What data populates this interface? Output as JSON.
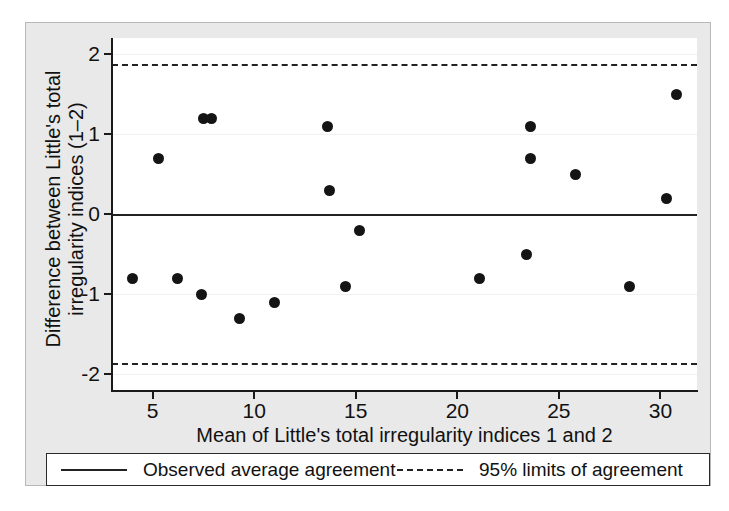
{
  "chart_data": {
    "type": "scatter",
    "title": "",
    "xlabel": "Mean of Little's total irregularity indices 1 and 2",
    "ylabel_line1": "Difference between Little's total",
    "ylabel_line2": "irregularity indices (1–2)",
    "xlim": [
      3.0,
      31.8
    ],
    "ylim": [
      -2.2,
      2.2
    ],
    "xticks": [
      5,
      10,
      15,
      20,
      25,
      30
    ],
    "xticklabels": [
      "5",
      "10",
      "15",
      "20",
      "25",
      "30"
    ],
    "yticks": [
      -2,
      -1,
      0,
      1,
      2
    ],
    "yticklabels": [
      "-2",
      "-1",
      "0",
      "1",
      "2"
    ],
    "grid": "faint-horizontal",
    "legend_position": "below-axes",
    "x": [
      4.0,
      5.3,
      6.2,
      7.4,
      7.5,
      7.9,
      9.3,
      11.0,
      13.6,
      13.7,
      14.5,
      15.2,
      21.1,
      23.4,
      23.6,
      23.6,
      25.8,
      28.5,
      30.3,
      30.8
    ],
    "y": [
      -0.8,
      0.7,
      -0.8,
      -1.0,
      1.2,
      1.2,
      -1.3,
      -1.1,
      1.1,
      0.3,
      -0.9,
      -0.2,
      -0.8,
      -0.5,
      0.7,
      1.1,
      0.5,
      -0.9,
      0.2,
      1.5
    ],
    "reference_lines": [
      {
        "name": "observed-average-agreement",
        "value": 0.0,
        "style": "solid"
      },
      {
        "name": "upper-limit-of-agreement",
        "value": 1.87,
        "style": "dashed"
      },
      {
        "name": "lower-limit-of-agreement",
        "value": -1.86,
        "style": "dash-dot"
      }
    ],
    "series": [
      {
        "name": "Difference vs mean",
        "marker": "filled-circle",
        "color": "#141414"
      }
    ]
  },
  "legend": {
    "items": [
      {
        "label": "Observed average agreement",
        "style": "solid",
        "icon": "solid-line-icon"
      },
      {
        "label": "95% limits of agreement",
        "style": "dashed",
        "icon": "dashed-line-icon"
      }
    ]
  },
  "colors": {
    "marker": "#141414",
    "axis": "#1a1a1a",
    "reference": "#222222",
    "backdrop": "#e9e9e9",
    "plot_background": "#ffffff",
    "gridline": "#f0f0f0"
  }
}
